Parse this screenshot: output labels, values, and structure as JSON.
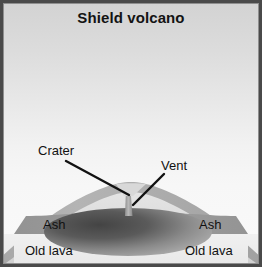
{
  "figure": {
    "title": "Shield volcano",
    "type": "geology-cross-section-diagram",
    "labels": {
      "crater": "Crater",
      "vent": "Vent",
      "ash_left": "Ash",
      "ash_right": "Ash",
      "old_lava_left": "Old lava",
      "old_lava_right": "Old lava"
    },
    "colors": {
      "frame": "#4a4a4a",
      "sky_top": "#d3d3d3",
      "sky_bottom": "#fafafa",
      "new_lava_crust": "#b0b0b0",
      "cone_interior": "#dcdcdc",
      "ash_layer": "#9a9a9a",
      "old_lava_layer": "#eeeeee",
      "magma_dark": "#4f4f4f",
      "magma_light": "#a8a8a8",
      "leader_line": "#111111",
      "label_text": "#111111",
      "title_text": "#131313"
    }
  }
}
